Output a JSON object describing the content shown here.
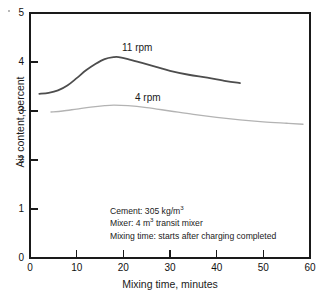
{
  "chart_data": {
    "type": "line",
    "title": "",
    "xlabel": "Mixing time, minutes",
    "ylabel": "Air content, percent",
    "xlim": [
      0,
      60
    ],
    "ylim": [
      0,
      5
    ],
    "xticks": [
      0,
      10,
      20,
      30,
      40,
      50,
      60
    ],
    "yticks": [
      0,
      1,
      2,
      3,
      4,
      5
    ],
    "grid": false,
    "legend_position": "inline-labels",
    "series": [
      {
        "name": "11 rpm",
        "color": "#4d4d4d",
        "x": [
          2.0,
          4.0,
          6.0,
          8.0,
          10.0,
          12.0,
          14.0,
          16.0,
          18.0,
          19.0,
          21.0,
          24.0,
          27.0,
          30.0,
          34.0,
          38.0,
          42.0,
          45.0
        ],
        "y": [
          3.35,
          3.37,
          3.42,
          3.52,
          3.67,
          3.83,
          3.96,
          4.06,
          4.1,
          4.1,
          4.06,
          3.98,
          3.9,
          3.82,
          3.74,
          3.68,
          3.61,
          3.57
        ]
      },
      {
        "name": "4 rpm",
        "color": "#b3b3b3",
        "x": [
          4.5,
          7.0,
          10.0,
          13.0,
          16.0,
          18.0,
          21.0,
          25.0,
          30.0,
          35.0,
          40.0,
          45.0,
          50.0,
          55.0,
          58.5
        ],
        "y": [
          2.98,
          3.0,
          3.04,
          3.08,
          3.11,
          3.12,
          3.11,
          3.07,
          3.0,
          2.93,
          2.87,
          2.82,
          2.78,
          2.75,
          2.73
        ]
      }
    ],
    "annotations": [
      "Cement: 305 kg/m3",
      "Mixer: 4 m3 transit mixer",
      "Mixing time: starts after charging completed"
    ],
    "annotation_lines": [
      {
        "prefix": "Cement: 305 kg/m",
        "sup": "3",
        "suffix": ""
      },
      {
        "prefix": "Mixer: 4 m",
        "sup": "3",
        "suffix": " transit mixer"
      },
      {
        "prefix": "Mixing time: starts after charging completed",
        "sup": "",
        "suffix": ""
      }
    ],
    "axis_color": "#1a1a1a"
  }
}
